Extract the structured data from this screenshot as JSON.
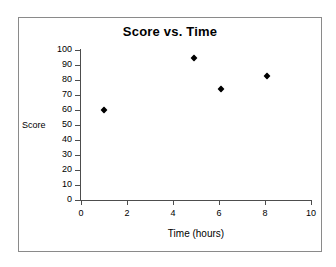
{
  "chart_data": {
    "type": "scatter",
    "title": "Score vs. Time",
    "xlabel": "Time (hours)",
    "ylabel": "Score",
    "xlim": [
      0,
      10
    ],
    "ylim": [
      0,
      100
    ],
    "xticks": [
      0,
      2,
      4,
      6,
      8,
      10
    ],
    "yticks": [
      0,
      10,
      20,
      30,
      40,
      50,
      60,
      70,
      80,
      90,
      100
    ],
    "xtick_labels": [
      "0",
      "2",
      "4",
      "6",
      "8",
      "10"
    ],
    "ytick_labels": [
      "0",
      "10",
      "20",
      "30",
      "40",
      "50",
      "60",
      "70",
      "80",
      "90",
      "100"
    ],
    "grid": false,
    "legend": false,
    "marker": "diamond",
    "marker_color": "#000000",
    "series": [
      {
        "name": "Score",
        "points": [
          {
            "x": 1.0,
            "y": 60
          },
          {
            "x": 4.9,
            "y": 95
          },
          {
            "x": 6.1,
            "y": 74
          },
          {
            "x": 8.1,
            "y": 83
          }
        ]
      }
    ]
  },
  "figure": {
    "background_color": "#ffffff",
    "frame_color": "#8a8a8a",
    "axis_color": "#4d4d4d"
  }
}
